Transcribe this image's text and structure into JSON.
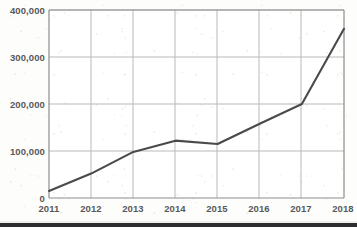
{
  "chart_data": {
    "type": "line",
    "title": "",
    "subtitle": "",
    "xlabel": "",
    "ylabel": "",
    "categories": [
      "2011",
      "2012",
      "2013",
      "2014",
      "2015",
      "2016",
      "2017",
      "2018"
    ],
    "values": [
      15000,
      52000,
      98000,
      122000,
      115000,
      158000,
      200000,
      360000
    ],
    "series": [
      {
        "name": "",
        "values": [
          15000,
          52000,
          98000,
          122000,
          115000,
          158000,
          200000,
          360000
        ]
      }
    ],
    "x_tick_labels": [
      "2011",
      "2012",
      "2013",
      "2014",
      "2015",
      "2016",
      "2017",
      "2018"
    ],
    "y_tick_labels": [
      "0",
      "100,000",
      "200,000",
      "300,000",
      "400,000"
    ],
    "y_tick_values": [
      0,
      100000,
      200000,
      300000,
      400000
    ],
    "ylim": [
      0,
      400000
    ],
    "xlim": [
      "2011",
      "2018"
    ],
    "grid": true,
    "grid_axes": "both",
    "legend": false,
    "legend_position": "none",
    "markers": false,
    "annotations": []
  },
  "style": {
    "line_color": "#4a4a4c",
    "grid_color": "#b9b9b7",
    "frame_color": "#8d8d8b",
    "label_color": "#58585a",
    "background_color": "#fdfdfc",
    "artifact_bar_color": "#2e2e30"
  }
}
